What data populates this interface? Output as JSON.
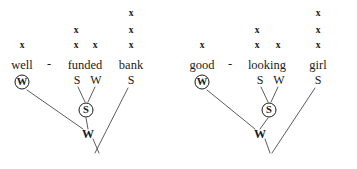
{
  "figure": {
    "caption_present": false,
    "line_color": "#4a4a4a",
    "text_color": "#1a1a1a",
    "background": "#ffffff"
  },
  "trees": [
    {
      "id": "tree-left",
      "phrase": "well - funded bank",
      "tokens": [
        {
          "name": "token-well",
          "text": "well",
          "x": 22,
          "y": 65
        },
        {
          "name": "token-hyphen",
          "text": "-",
          "x": 49,
          "y": 64
        },
        {
          "name": "token-funded",
          "text": "funded",
          "x": 85,
          "y": 65
        },
        {
          "name": "token-bank",
          "text": "bank",
          "x": 131,
          "y": 65
        }
      ],
      "xmarks": [
        {
          "text": "x",
          "x": 22,
          "y": 46
        },
        {
          "text": "x",
          "x": 76,
          "y": 46
        },
        {
          "text": "x",
          "x": 76,
          "y": 31
        },
        {
          "text": "x",
          "x": 95,
          "y": 46
        },
        {
          "text": "x",
          "x": 131,
          "y": 46
        },
        {
          "text": "x",
          "x": 131,
          "y": 31
        },
        {
          "text": "x",
          "x": 131,
          "y": 14
        }
      ],
      "categories": [
        {
          "name": "cat-funded-left",
          "text": "S",
          "x": 77,
          "y": 80,
          "style": "plain"
        },
        {
          "name": "cat-funded-right",
          "text": "W",
          "x": 96,
          "y": 80,
          "style": "plain"
        },
        {
          "name": "cat-bank",
          "text": "S",
          "x": 131,
          "y": 80,
          "style": "plain"
        },
        {
          "name": "cat-root",
          "text": "W",
          "x": 88,
          "y": 134,
          "style": "bold"
        }
      ],
      "circled": [
        {
          "name": "circled-node-w",
          "text": "W",
          "x": 22,
          "y": 82
        },
        {
          "name": "circled-node-s",
          "text": "S",
          "x": 86,
          "y": 110
        }
      ],
      "edges": [
        {
          "x1": 27,
          "y1": 90,
          "x2": 83,
          "y2": 129
        },
        {
          "x1": 78,
          "y1": 87,
          "x2": 85,
          "y2": 102
        },
        {
          "x1": 95,
          "y1": 87,
          "x2": 88,
          "y2": 102
        },
        {
          "x1": 86,
          "y1": 118,
          "x2": 88,
          "y2": 129
        },
        {
          "x1": 128,
          "y1": 88,
          "x2": 95,
          "y2": 153
        },
        {
          "x1": 93,
          "y1": 139,
          "x2": 99,
          "y2": 153
        }
      ]
    },
    {
      "id": "tree-right",
      "phrase": "good - looking girl",
      "tokens": [
        {
          "name": "token-good",
          "text": "good",
          "x": 22,
          "y": 65
        },
        {
          "name": "token-hyphen",
          "text": "-",
          "x": 50,
          "y": 64
        },
        {
          "name": "token-looking",
          "text": "looking",
          "x": 87,
          "y": 65
        },
        {
          "name": "token-girl",
          "text": "girl",
          "x": 138,
          "y": 65
        }
      ],
      "xmarks": [
        {
          "text": "x",
          "x": 22,
          "y": 46
        },
        {
          "text": "x",
          "x": 77,
          "y": 46
        },
        {
          "text": "x",
          "x": 77,
          "y": 31
        },
        {
          "text": "x",
          "x": 98,
          "y": 46
        },
        {
          "text": "x",
          "x": 138,
          "y": 46
        },
        {
          "text": "x",
          "x": 138,
          "y": 31
        },
        {
          "text": "x",
          "x": 138,
          "y": 14
        }
      ],
      "categories": [
        {
          "name": "cat-looking-left",
          "text": "S",
          "x": 80,
          "y": 80,
          "style": "plain"
        },
        {
          "name": "cat-looking-right",
          "text": "W",
          "x": 99,
          "y": 80,
          "style": "plain"
        },
        {
          "name": "cat-girl",
          "text": "S",
          "x": 138,
          "y": 80,
          "style": "plain"
        },
        {
          "name": "cat-root",
          "text": "W",
          "x": 80,
          "y": 134,
          "style": "bold"
        }
      ],
      "circled": [
        {
          "name": "circled-node-w",
          "text": "W",
          "x": 22,
          "y": 82
        },
        {
          "name": "circled-node-s",
          "text": "S",
          "x": 89,
          "y": 110
        }
      ],
      "edges": [
        {
          "x1": 27,
          "y1": 90,
          "x2": 75,
          "y2": 129
        },
        {
          "x1": 81,
          "y1": 87,
          "x2": 88,
          "y2": 102
        },
        {
          "x1": 98,
          "y1": 87,
          "x2": 91,
          "y2": 102
        },
        {
          "x1": 88,
          "y1": 118,
          "x2": 80,
          "y2": 129
        },
        {
          "x1": 135,
          "y1": 88,
          "x2": 92,
          "y2": 153
        },
        {
          "x1": 85,
          "y1": 139,
          "x2": 90,
          "y2": 153
        }
      ]
    }
  ]
}
